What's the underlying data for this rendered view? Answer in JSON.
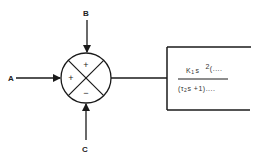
{
  "diagram": {
    "type": "block-diagram",
    "inputs": [
      {
        "id": "A",
        "label": "A",
        "sign": "+",
        "direction": "left"
      },
      {
        "id": "B",
        "label": "B",
        "sign": "+",
        "direction": "top"
      },
      {
        "id": "C",
        "label": "C",
        "sign": "−",
        "direction": "bottom"
      }
    ],
    "summing_junction": {
      "signs": {
        "left": "+",
        "top": "+",
        "bottom": "−"
      }
    },
    "transfer_block": {
      "numerator": {
        "coef": "K",
        "coef_sub": "1",
        "var": "s",
        "exponent": "2",
        "tail": "(...."
      },
      "denominator": {
        "open": "(τ",
        "sub": "2",
        "rest": "s  +1)...."
      }
    },
    "colors": {
      "stroke": "#1a1a1a",
      "background": "#ffffff"
    }
  }
}
